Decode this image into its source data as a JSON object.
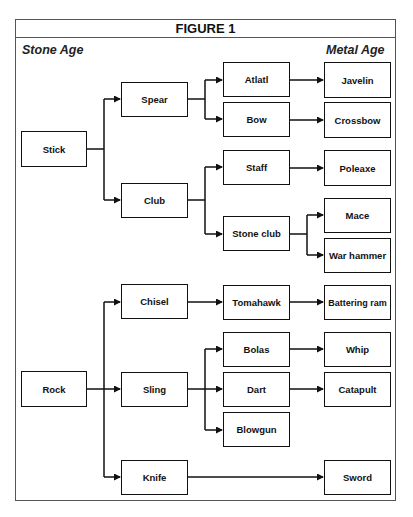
{
  "figure": {
    "title": "FIGURE 1",
    "left_label": "Stone Age",
    "right_label": "Metal Age"
  },
  "nodes": {
    "stick": "Stick",
    "spear": "Spear",
    "club": "Club",
    "atlatl": "Atlatl",
    "bow": "Bow",
    "staff": "Staff",
    "stone_club": "Stone club",
    "javelin": "Javelin",
    "crossbow": "Crossbow",
    "poleaxe": "Poleaxe",
    "mace": "Mace",
    "war_hammer": "War hammer",
    "rock": "Rock",
    "chisel": "Chisel",
    "sling": "Sling",
    "knife": "Knife",
    "tomahawk": "Tomahawk",
    "bolas": "Bolas",
    "dart": "Dart",
    "blowgun": "Blowgun",
    "battering_ram": "Battering ram",
    "whip": "Whip",
    "catapult": "Catapult",
    "sword": "Sword"
  },
  "edges": [
    [
      "Stick",
      "Spear"
    ],
    [
      "Stick",
      "Club"
    ],
    [
      "Spear",
      "Atlatl"
    ],
    [
      "Spear",
      "Bow"
    ],
    [
      "Club",
      "Staff"
    ],
    [
      "Club",
      "Stone club"
    ],
    [
      "Atlatl",
      "Javelin"
    ],
    [
      "Bow",
      "Crossbow"
    ],
    [
      "Staff",
      "Poleaxe"
    ],
    [
      "Stone club",
      "Mace"
    ],
    [
      "Stone club",
      "War hammer"
    ],
    [
      "Rock",
      "Chisel"
    ],
    [
      "Rock",
      "Sling"
    ],
    [
      "Rock",
      "Knife"
    ],
    [
      "Chisel",
      "Tomahawk"
    ],
    [
      "Tomahawk",
      "Battering ram"
    ],
    [
      "Sling",
      "Bolas"
    ],
    [
      "Sling",
      "Dart"
    ],
    [
      "Sling",
      "Blowgun"
    ],
    [
      "Bolas",
      "Whip"
    ],
    [
      "Dart",
      "Catapult"
    ],
    [
      "Knife",
      "Sword"
    ]
  ]
}
